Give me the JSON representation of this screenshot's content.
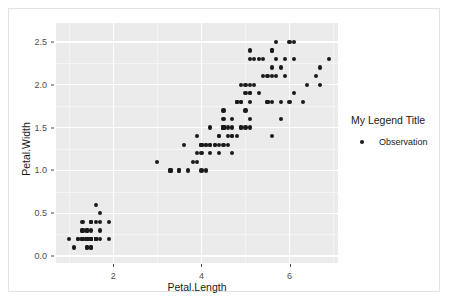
{
  "chart_data": {
    "type": "scatter",
    "title": "",
    "xlabel": "Petal.Length",
    "ylabel": "Petal.Width",
    "xlim": [
      0.7,
      7.1
    ],
    "ylim": [
      -0.08,
      2.72
    ],
    "xticks": [
      2,
      4,
      6
    ],
    "xticklabels": [
      "2",
      "4",
      "6"
    ],
    "yticks": [
      0.0,
      0.5,
      1.0,
      1.5,
      2.0,
      2.5
    ],
    "yticklabels": [
      "0.0",
      "0.5",
      "1.0",
      "1.5",
      "2.0",
      "2.5"
    ],
    "xminor": [
      1,
      3,
      5,
      7
    ],
    "yminor": [
      0.25,
      0.75,
      1.25,
      1.75,
      2.25
    ],
    "grid": true,
    "legend_position": "right",
    "panel_background": "#ebebeb",
    "grid_color": "#ffffff",
    "point_color": "#1a1a1a",
    "series": [
      {
        "name": "Observation",
        "x": [
          1.4,
          1.4,
          1.3,
          1.5,
          1.4,
          1.7,
          1.4,
          1.5,
          1.4,
          1.5,
          1.5,
          1.6,
          1.4,
          1.1,
          1.2,
          1.5,
          1.3,
          1.4,
          1.7,
          1.5,
          1.7,
          1.5,
          1.0,
          1.7,
          1.9,
          1.6,
          1.6,
          1.5,
          1.4,
          1.6,
          1.6,
          1.5,
          1.5,
          1.4,
          1.5,
          1.2,
          1.3,
          1.4,
          1.3,
          1.5,
          1.3,
          1.3,
          1.3,
          1.6,
          1.9,
          1.4,
          1.6,
          1.4,
          1.5,
          1.4,
          4.7,
          4.5,
          4.9,
          4.0,
          4.6,
          4.5,
          4.7,
          3.3,
          4.6,
          3.9,
          3.5,
          4.2,
          4.0,
          4.7,
          3.6,
          4.4,
          4.5,
          4.1,
          4.5,
          3.9,
          4.8,
          4.0,
          4.9,
          4.7,
          4.3,
          4.4,
          4.8,
          5.0,
          4.5,
          3.5,
          3.8,
          3.7,
          3.9,
          5.1,
          4.5,
          4.5,
          4.7,
          4.4,
          4.1,
          4.0,
          4.4,
          4.6,
          4.0,
          3.3,
          4.2,
          4.2,
          4.2,
          4.3,
          3.0,
          4.1,
          6.0,
          5.1,
          5.9,
          5.6,
          5.8,
          6.6,
          4.5,
          6.3,
          5.8,
          6.1,
          5.1,
          5.3,
          5.5,
          5.0,
          5.1,
          5.3,
          5.5,
          6.7,
          6.9,
          5.0,
          5.7,
          4.9,
          6.7,
          4.9,
          5.7,
          6.0,
          4.8,
          4.9,
          5.6,
          5.8,
          6.1,
          6.4,
          5.6,
          5.1,
          5.6,
          6.1,
          5.6,
          5.5,
          4.8,
          5.4,
          5.6,
          5.1,
          5.1,
          5.9,
          5.7,
          5.2,
          5.0,
          5.2,
          5.4,
          5.1
        ],
        "y": [
          0.2,
          0.2,
          0.2,
          0.2,
          0.2,
          0.4,
          0.3,
          0.2,
          0.2,
          0.1,
          0.2,
          0.2,
          0.1,
          0.1,
          0.2,
          0.4,
          0.4,
          0.3,
          0.3,
          0.3,
          0.2,
          0.4,
          0.2,
          0.5,
          0.2,
          0.2,
          0.4,
          0.2,
          0.2,
          0.2,
          0.2,
          0.4,
          0.1,
          0.2,
          0.2,
          0.2,
          0.2,
          0.1,
          0.2,
          0.2,
          0.3,
          0.3,
          0.2,
          0.6,
          0.4,
          0.3,
          0.2,
          0.2,
          0.2,
          0.2,
          1.4,
          1.5,
          1.5,
          1.3,
          1.5,
          1.3,
          1.6,
          1.0,
          1.3,
          1.4,
          1.0,
          1.5,
          1.0,
          1.4,
          1.3,
          1.4,
          1.5,
          1.0,
          1.5,
          1.1,
          1.8,
          1.3,
          1.5,
          1.2,
          1.3,
          1.4,
          1.4,
          1.7,
          1.5,
          1.0,
          1.1,
          1.0,
          1.2,
          1.6,
          1.5,
          1.6,
          1.5,
          1.3,
          1.3,
          1.3,
          1.2,
          1.4,
          1.2,
          1.0,
          1.3,
          1.2,
          1.3,
          1.3,
          1.1,
          1.3,
          2.5,
          1.9,
          2.1,
          1.8,
          2.2,
          2.1,
          1.7,
          1.8,
          1.8,
          2.5,
          2.0,
          1.9,
          2.1,
          2.0,
          2.4,
          2.3,
          1.8,
          2.2,
          2.3,
          1.5,
          2.3,
          2.0,
          2.0,
          1.8,
          2.1,
          1.8,
          1.8,
          1.8,
          2.1,
          1.6,
          1.9,
          2.0,
          2.2,
          1.5,
          1.4,
          2.3,
          2.4,
          1.8,
          1.8,
          2.1,
          2.4,
          2.3,
          1.9,
          2.3,
          2.5,
          2.3,
          1.9,
          2.0,
          2.3,
          1.8
        ]
      }
    ]
  },
  "legend": {
    "title": "My Legend Title",
    "entries": [
      {
        "label": "Observation",
        "marker": "point-marker",
        "color": "#1a1a1a"
      }
    ]
  },
  "axes": {
    "x_title": "Petal.Length",
    "y_title": "Petal.Width"
  }
}
